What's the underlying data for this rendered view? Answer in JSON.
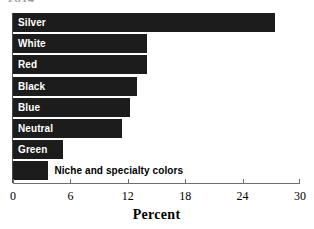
{
  "title_remnant": "2014",
  "chart_data": {
    "type": "bar",
    "orientation": "horizontal",
    "title": "",
    "xlabel": "Percent",
    "ylabel": "",
    "xlim": [
      0,
      30
    ],
    "xticks": [
      0,
      6,
      12,
      18,
      24,
      30
    ],
    "xtick_labels": [
      "0",
      "6",
      "12",
      "18",
      "24",
      "30"
    ],
    "grid": false,
    "legend": false,
    "bar_color": "#1c1c1c",
    "categories": [
      "Silver",
      "White",
      "Red",
      "Black",
      "Blue",
      "Neutral",
      "Green",
      "Niche and specialty colors"
    ],
    "values": [
      27.4,
      14.0,
      14.0,
      13.0,
      12.2,
      11.4,
      5.2,
      3.7
    ],
    "bars": [
      {
        "label": "Silver",
        "value": 27.4,
        "label_position": "inside"
      },
      {
        "label": "White",
        "value": 14.0,
        "label_position": "inside"
      },
      {
        "label": "Red",
        "value": 14.0,
        "label_position": "inside"
      },
      {
        "label": "Black",
        "value": 13.0,
        "label_position": "inside"
      },
      {
        "label": "Blue",
        "value": 12.2,
        "label_position": "inside"
      },
      {
        "label": "Neutral",
        "value": 11.4,
        "label_position": "inside"
      },
      {
        "label": "Green",
        "value": 5.2,
        "label_position": "inside"
      },
      {
        "label": "Niche and specialty colors",
        "value": 3.7,
        "label_position": "outside"
      }
    ]
  }
}
